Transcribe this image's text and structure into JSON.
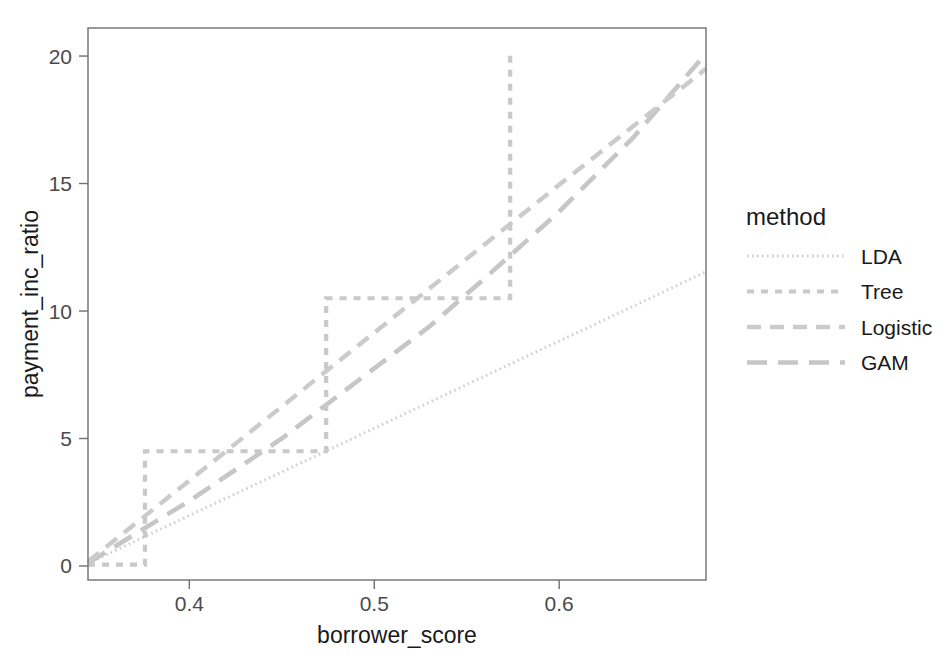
{
  "chart_data": {
    "type": "line",
    "title": "",
    "xlabel": "borrower_score",
    "ylabel": "payment_inc_ratio",
    "xlim": [
      0.3452,
      0.6794
    ],
    "ylim": [
      -0.55,
      21.1
    ],
    "xticks": [
      0.4,
      0.5,
      0.6
    ],
    "xticklabels": [
      "0.4",
      "0.5",
      "0.6"
    ],
    "yticks": [
      0,
      5,
      10,
      15,
      20
    ],
    "yticklabels": [
      "0",
      "5",
      "10",
      "15",
      "20"
    ],
    "grid": false,
    "legend": {
      "title": "method",
      "position": "right",
      "entries": [
        {
          "label": "LDA",
          "dash": "dotted-fine",
          "color": "#cfcfcf"
        },
        {
          "label": "Tree",
          "dash": "dashed-short",
          "color": "#c9c9c9"
        },
        {
          "label": "Logistic",
          "dash": "dashed-medium",
          "color": "#cbcbcb"
        },
        {
          "label": "GAM",
          "dash": "dashed-long",
          "color": "#c6c6c6"
        }
      ]
    },
    "series": [
      {
        "name": "LDA",
        "interpolation": "linear",
        "dash": "dotted-fine",
        "color": "#d0d0d0",
        "points": [
          [
            0.3452,
            0.1
          ],
          [
            0.37,
            0.95
          ],
          [
            0.4,
            1.98
          ],
          [
            0.43,
            3.0
          ],
          [
            0.46,
            4.03
          ],
          [
            0.5,
            5.4
          ],
          [
            0.54,
            6.77
          ],
          [
            0.58,
            8.14
          ],
          [
            0.62,
            9.5
          ],
          [
            0.65,
            10.53
          ],
          [
            0.6794,
            11.54
          ]
        ],
        "note": "lowest, nearly-straight fine dotted line"
      },
      {
        "name": "Tree",
        "interpolation": "step",
        "dash": "dashed-short",
        "color": "#c9c9c9",
        "points": [
          [
            0.3452,
            0.05
          ],
          [
            0.376,
            0.05
          ],
          [
            0.376,
            4.5
          ],
          [
            0.474,
            4.5
          ],
          [
            0.474,
            10.5
          ],
          [
            0.5735,
            10.5
          ],
          [
            0.5735,
            20.05
          ],
          [
            0.5735,
            20.05
          ]
        ],
        "note": "piecewise-constant step function with three risers"
      },
      {
        "name": "Logistic",
        "interpolation": "linear",
        "dash": "dashed-medium",
        "color": "#cbcbcb",
        "points": [
          [
            0.3452,
            0.18
          ],
          [
            0.4,
            3.35
          ],
          [
            0.45,
            6.25
          ],
          [
            0.5,
            9.15
          ],
          [
            0.55,
            12.05
          ],
          [
            0.6,
            14.95
          ],
          [
            0.64,
            17.25
          ],
          [
            0.6794,
            19.5
          ]
        ],
        "note": "upper dashed line, steepest slope"
      },
      {
        "name": "GAM",
        "interpolation": "linear",
        "dash": "dashed-long",
        "color": "#c6c6c6",
        "points": [
          [
            0.3452,
            0.12
          ],
          [
            0.4,
            2.55
          ],
          [
            0.45,
            5.0
          ],
          [
            0.5,
            7.75
          ],
          [
            0.53,
            9.4
          ],
          [
            0.56,
            11.3
          ],
          [
            0.6,
            13.9
          ],
          [
            0.64,
            16.8
          ],
          [
            0.6794,
            20.1
          ]
        ],
        "note": "long-dash line tracking just above LDA, crossing Logistic near the top-right"
      }
    ]
  },
  "axes": {
    "x_title": "borrower_score",
    "y_title": "payment_inc_ratio"
  }
}
